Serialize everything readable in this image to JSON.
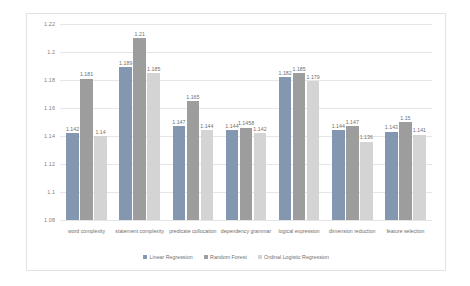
{
  "chart_data": {
    "type": "bar",
    "title": "",
    "xlabel": "",
    "ylabel": "",
    "ylim": [
      1.08,
      1.22
    ],
    "ytick_step": 0.02,
    "yticks": [
      "1.22",
      "1.2",
      "1.18",
      "1.16",
      "1.14",
      "1.12",
      "1.1",
      "1.08"
    ],
    "grid": true,
    "legend_position": "bottom",
    "categories": [
      "word complexity",
      "statement complexity",
      "predicate collocation",
      "dependency grammar",
      "logical expression",
      "dimension reduction",
      "feature selection"
    ],
    "series": [
      {
        "name": "Linear Regression",
        "color": "#8497b0",
        "values": [
          1.142,
          1.189,
          1.147,
          1.144,
          1.182,
          1.144,
          1.143
        ],
        "labels": [
          "1.142",
          "1.189",
          "1.147",
          "1.144",
          "1.182",
          "1.144",
          "1.143"
        ]
      },
      {
        "name": "Random Forest",
        "color": "#9d9d9d",
        "values": [
          1.181,
          1.21,
          1.165,
          1.1458,
          1.185,
          1.147,
          1.15
        ],
        "labels": [
          "1.181",
          "1.21",
          "1.165",
          "1.1458",
          "1.185",
          "1.147",
          "1.15"
        ]
      },
      {
        "name": "Ordinal Logistic Regression",
        "color": "#d4d4d4",
        "values": [
          1.14,
          1.185,
          1.144,
          1.142,
          1.179,
          1.136,
          1.141
        ],
        "labels": [
          "1.14",
          "1.185",
          "1.144",
          "1.142",
          "1.179",
          "1.136",
          "1.141"
        ]
      }
    ]
  }
}
